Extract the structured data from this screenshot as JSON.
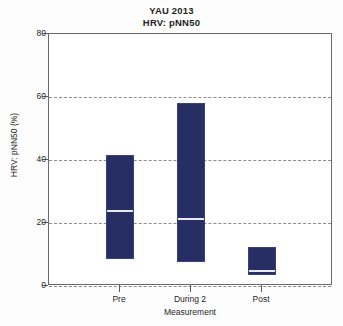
{
  "chart_data": {
    "type": "bar",
    "title": "YAU 2013",
    "subtitle": "HRV: pNN50",
    "xlabel": "Measurement",
    "ylabel": "HRV: pNN50 (%)",
    "categories": [
      "Pre",
      "During 2",
      "Post"
    ],
    "ylim": [
      0,
      80
    ],
    "yticks": [
      0,
      20,
      40,
      60,
      80
    ],
    "ytick_labels": [
      "0",
      "20",
      "40",
      "60",
      "80"
    ],
    "grid": true,
    "legend": "none",
    "bar_color": "#272e63",
    "median_color": "#e9eaf2",
    "series": [
      {
        "name": "pNN50 range",
        "boxes": [
          {
            "category": "Pre",
            "low": 8.5,
            "median": 24.0,
            "high": 41.5
          },
          {
            "category": "During 2",
            "low": 7.5,
            "median": 21.5,
            "high": 58.0
          },
          {
            "category": "Post",
            "low": 3.5,
            "median": 5.0,
            "high": 12.5
          }
        ]
      }
    ]
  }
}
